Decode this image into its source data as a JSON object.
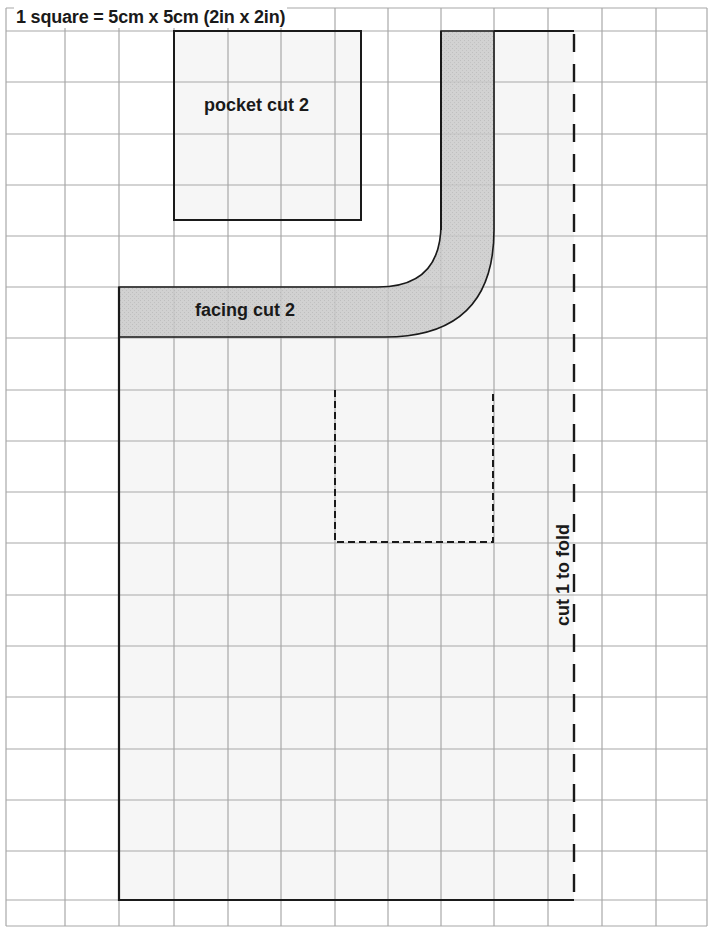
{
  "pattern": {
    "scale_label": "1 square = 5cm x 5cm (2in x 2in)",
    "grid": {
      "x_lines": [
        6,
        65,
        119,
        174,
        228,
        281,
        335,
        388,
        441,
        494,
        548,
        602,
        656,
        707
      ],
      "y_lines": [
        8,
        31,
        82,
        134,
        185,
        236,
        287,
        338,
        390,
        441,
        492,
        543,
        595,
        646,
        697,
        749,
        800,
        851,
        900,
        926
      ],
      "line_color": "#a8a8a8"
    },
    "pieces": [
      {
        "id": "pocket",
        "label": "pocket cut 2",
        "fill": "#f6f6f6"
      },
      {
        "id": "facing",
        "label": "facing cut 2",
        "fill": "#c9c9c9"
      },
      {
        "id": "main",
        "label": "cut 1 to fold",
        "fill": "#f6f6f6"
      }
    ],
    "colors": {
      "outline": "#1a1a1a",
      "piece_fill": "#f6f6f6",
      "facing_fill": "#c9c9c9",
      "background": "#ffffff"
    }
  }
}
